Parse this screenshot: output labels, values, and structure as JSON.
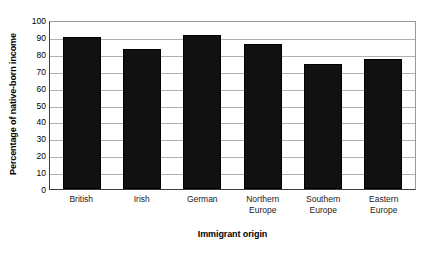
{
  "chart_data": {
    "type": "bar",
    "title": "",
    "subtitle": "",
    "categories": [
      "British",
      "Irish",
      "German",
      "Northern Europe",
      "Southern Europe",
      "Eastern Europe"
    ],
    "values": [
      91,
      84,
      92,
      87,
      75,
      78
    ],
    "xlabel": "Immigrant origin",
    "ylabel": "Percentage of native-born income",
    "ylim": [
      0,
      100
    ],
    "ytick_step": 10,
    "yticks": [
      100,
      90,
      80,
      70,
      60,
      50,
      40,
      30,
      20,
      10,
      0
    ],
    "ytick_labels": [
      "100",
      "90",
      "80",
      "70",
      "60",
      "50",
      "40",
      "30",
      "20",
      "10",
      "0"
    ],
    "grid": "horizontal",
    "legend": "none",
    "bar_color": "#111111",
    "grid_color": "#b0b0b0",
    "axis_color": "#3c3c3c",
    "background_color": "#ffffff",
    "annotations": []
  },
  "category_lines": [
    [
      "British"
    ],
    [
      "Irish"
    ],
    [
      "German"
    ],
    [
      "Northern",
      "Europe"
    ],
    [
      "Southern",
      "Europe"
    ],
    [
      "Eastern",
      "Europe"
    ]
  ]
}
